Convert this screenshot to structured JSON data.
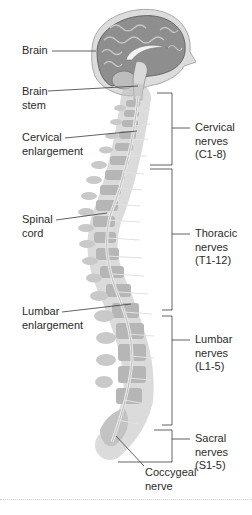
{
  "figure": {
    "left_labels": [
      {
        "id": "brain",
        "text": "Brain",
        "x": 22,
        "y": 44
      },
      {
        "id": "brain-stem",
        "text": "Brain\nstem",
        "x": 22,
        "y": 87
      },
      {
        "id": "cervical-enlargement",
        "text": "Cervical\nenlargement",
        "x": 22,
        "y": 133
      },
      {
        "id": "spinal-cord",
        "text": "Spinal\ncord",
        "x": 22,
        "y": 215
      },
      {
        "id": "lumbar-enlargement",
        "text": "Lumbar\nenlargement",
        "x": 22,
        "y": 306
      }
    ],
    "right_labels": [
      {
        "id": "cervical-nerves",
        "text": "Cervical\nnerves\n(C1-8)",
        "x": 195,
        "y": 120
      },
      {
        "id": "thoracic-nerves",
        "text": "Thoracic\nnerves\n(T1-12)",
        "x": 195,
        "y": 226
      },
      {
        "id": "lumbar-nerves",
        "text": "Lumbar\nnerves\n(L1-5)",
        "x": 195,
        "y": 336
      },
      {
        "id": "sacral-nerves",
        "text": "Sacral\nnerves\n(S1-5)",
        "x": 195,
        "y": 430
      }
    ],
    "bottom_label": {
      "id": "coccygeal-nerve",
      "text": "Coccygeal\nnerve",
      "x": 145,
      "y": 465
    },
    "colors": {
      "leader_line": "#3a3a3a",
      "bone": "#b9b9b9",
      "bone_dark": "#9a9a9a",
      "cord": "#e6e6e6",
      "brain": "#8c8c8c",
      "skull": "#d6d6d6"
    }
  }
}
